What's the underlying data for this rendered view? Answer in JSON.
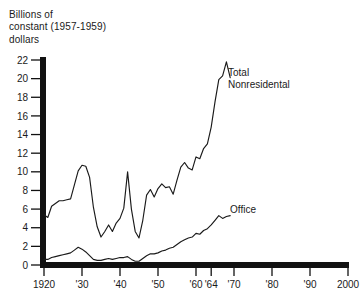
{
  "chart_data": {
    "type": "line",
    "title": "",
    "ylabel": "Billions of\nconstant (1957-1959)\ndollars",
    "xlabel": "",
    "xlim": [
      1920,
      2000
    ],
    "ylim": [
      0,
      22
    ],
    "grid": false,
    "legend_position": "inline-annotation",
    "ytick_labels": [
      "0",
      "2",
      "4",
      "6",
      "8",
      "10",
      "12",
      "14",
      "16",
      "18",
      "20",
      "22"
    ],
    "ytick_values": [
      0,
      2,
      4,
      6,
      8,
      10,
      12,
      14,
      16,
      18,
      20,
      22
    ],
    "xtick_labels": [
      "1920",
      "'30",
      "'40",
      "'50",
      "'60",
      "'64",
      "'70",
      "'80",
      "'90",
      "2000"
    ],
    "xtick_values": [
      1920,
      1930,
      1940,
      1950,
      1960,
      1964,
      1970,
      1980,
      1990,
      2000
    ],
    "series": [
      {
        "name": "Total Nonresidental",
        "annotation": "Total\nNonresidental",
        "annotation_line1": "Total",
        "annotation_line2": "Nonresidental",
        "x": [
          1920,
          1921,
          1922,
          1923,
          1924,
          1925,
          1926,
          1927,
          1928,
          1929,
          1930,
          1931,
          1932,
          1933,
          1934,
          1935,
          1936,
          1937,
          1938,
          1939,
          1940,
          1941,
          1942,
          1943,
          1944,
          1945,
          1946,
          1947,
          1948,
          1949,
          1950,
          1951,
          1952,
          1953,
          1954,
          1955,
          1956,
          1957,
          1958,
          1959,
          1960,
          1961,
          1962,
          1963,
          1964,
          1965,
          1966,
          1967,
          1968,
          1969
        ],
        "y": [
          5.4,
          5.1,
          6.3,
          6.6,
          6.9,
          6.9,
          7.0,
          7.1,
          8.6,
          10.1,
          10.7,
          10.6,
          9.4,
          6.2,
          4.1,
          3.0,
          3.6,
          4.3,
          3.6,
          4.5,
          5.0,
          6.1,
          10.0,
          6.0,
          3.6,
          2.9,
          4.8,
          7.5,
          8.1,
          7.3,
          8.2,
          8.7,
          8.3,
          8.4,
          7.6,
          9.1,
          10.5,
          11.0,
          10.4,
          10.2,
          11.6,
          11.4,
          12.5,
          13.0,
          14.8,
          17.5,
          19.9,
          20.3,
          21.8,
          20.1
        ],
        "color": "#1a1a1a"
      },
      {
        "name": "Office",
        "annotation": "Office",
        "x": [
          1920,
          1921,
          1922,
          1923,
          1924,
          1925,
          1926,
          1927,
          1928,
          1929,
          1930,
          1931,
          1932,
          1933,
          1934,
          1935,
          1936,
          1937,
          1938,
          1939,
          1940,
          1941,
          1942,
          1943,
          1944,
          1945,
          1946,
          1947,
          1948,
          1949,
          1950,
          1951,
          1952,
          1953,
          1954,
          1955,
          1956,
          1957,
          1958,
          1959,
          1960,
          1961,
          1962,
          1963,
          1964,
          1965,
          1966,
          1967,
          1968,
          1969
        ],
        "y": [
          0.6,
          0.6,
          0.8,
          0.9,
          1.0,
          1.1,
          1.2,
          1.3,
          1.6,
          1.9,
          1.7,
          1.4,
          1.0,
          0.6,
          0.5,
          0.5,
          0.6,
          0.7,
          0.6,
          0.7,
          0.8,
          0.8,
          0.9,
          0.6,
          0.4,
          0.4,
          0.7,
          1.0,
          1.2,
          1.2,
          1.3,
          1.5,
          1.6,
          1.8,
          1.9,
          2.2,
          2.5,
          2.7,
          2.9,
          3.0,
          3.4,
          3.3,
          3.7,
          3.9,
          4.3,
          4.8,
          5.3,
          5.0,
          5.2,
          5.3
        ],
        "color": "#1a1a1a"
      }
    ]
  }
}
